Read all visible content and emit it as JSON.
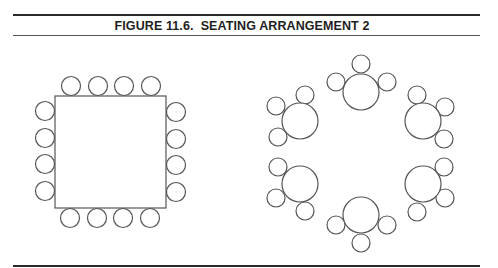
{
  "figure": {
    "title": "FIGURE 11.6.  SEATING ARRANGEMENT 2"
  },
  "colors": {
    "rule": "#2a2a2a",
    "stroke": "#555555",
    "background": "#ffffff"
  },
  "layouts": [
    {
      "name": "square-table-layout",
      "type": "banquet-square",
      "table": {
        "x": 55,
        "y": 96,
        "width": 111,
        "height": 112
      },
      "chair_radius": 9.5,
      "chairs": [
        {
          "side": "top",
          "cx": 71,
          "cy": 86
        },
        {
          "side": "top",
          "cx": 98,
          "cy": 86
        },
        {
          "side": "top",
          "cx": 124,
          "cy": 86
        },
        {
          "side": "top",
          "cx": 151,
          "cy": 86
        },
        {
          "side": "left",
          "cx": 45,
          "cy": 111
        },
        {
          "side": "left",
          "cx": 45,
          "cy": 138
        },
        {
          "side": "left",
          "cx": 45,
          "cy": 164
        },
        {
          "side": "left",
          "cx": 45,
          "cy": 191
        },
        {
          "side": "right",
          "cx": 176,
          "cy": 112
        },
        {
          "side": "right",
          "cx": 176,
          "cy": 139
        },
        {
          "side": "right",
          "cx": 176,
          "cy": 165
        },
        {
          "side": "right",
          "cx": 176,
          "cy": 192
        },
        {
          "side": "bottom",
          "cx": 70,
          "cy": 218
        },
        {
          "side": "bottom",
          "cx": 97,
          "cy": 218
        },
        {
          "side": "bottom",
          "cx": 123,
          "cy": 218
        },
        {
          "side": "bottom",
          "cx": 150,
          "cy": 218
        }
      ]
    },
    {
      "name": "round-tables-layout",
      "type": "round-cluster",
      "table_radius": 18,
      "chair_radius": 9,
      "tables": [
        {
          "position": "top",
          "cx": 361,
          "cy": 92,
          "chairs": [
            {
              "cx": 336,
              "cy": 82
            },
            {
              "cx": 361,
              "cy": 64
            },
            {
              "cx": 387,
              "cy": 82
            }
          ]
        },
        {
          "position": "upper-left",
          "cx": 300,
          "cy": 121,
          "chairs": [
            {
              "cx": 305,
              "cy": 95
            },
            {
              "cx": 276,
              "cy": 106
            },
            {
              "cx": 278,
              "cy": 137
            }
          ]
        },
        {
          "position": "upper-right",
          "cx": 423,
          "cy": 121,
          "chairs": [
            {
              "cx": 417,
              "cy": 95
            },
            {
              "cx": 445,
              "cy": 107
            },
            {
              "cx": 444,
              "cy": 139
            }
          ]
        },
        {
          "position": "lower-left",
          "cx": 300,
          "cy": 184,
          "chairs": [
            {
              "cx": 278,
              "cy": 167
            },
            {
              "cx": 276,
              "cy": 198
            },
            {
              "cx": 305,
              "cy": 211
            }
          ]
        },
        {
          "position": "lower-right",
          "cx": 423,
          "cy": 184,
          "chairs": [
            {
              "cx": 444,
              "cy": 167
            },
            {
              "cx": 445,
              "cy": 198
            },
            {
              "cx": 417,
              "cy": 212
            }
          ]
        },
        {
          "position": "bottom",
          "cx": 361,
          "cy": 215,
          "chairs": [
            {
              "cx": 336,
              "cy": 225
            },
            {
              "cx": 387,
              "cy": 225
            },
            {
              "cx": 361,
              "cy": 243
            }
          ]
        }
      ]
    }
  ]
}
